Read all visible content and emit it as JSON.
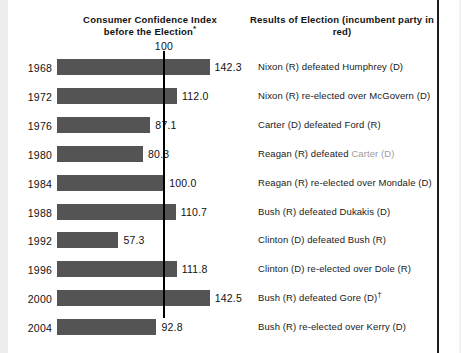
{
  "chart_data": {
    "type": "bar",
    "title": "Consumer Confidence Index before the Election*",
    "right_header": "Results of Election (incumbent party in red)",
    "xlabel": "",
    "ylabel": "",
    "orientation": "horizontal",
    "reference_line": {
      "value": 100,
      "label": "100"
    },
    "xlim": [
      0,
      160
    ],
    "grid": false,
    "legend": null,
    "bar_color": "#545454",
    "incumbent_color": "#9c9c9c",
    "categories": [
      "1968",
      "1972",
      "1976",
      "1980",
      "1984",
      "1988",
      "1992",
      "1996",
      "2000",
      "2004"
    ],
    "values": [
      142.3,
      112.0,
      87.1,
      80.3,
      100.0,
      110.7,
      57.3,
      111.8,
      142.5,
      92.8
    ],
    "value_labels": [
      "142.3",
      "112.0",
      "87.1",
      "80.3",
      "100.0",
      "110.7",
      "57.3",
      "111.8",
      "142.5",
      "92.8"
    ],
    "rows": [
      {
        "year": "1968",
        "value": 142.3,
        "value_label": "142.3",
        "result_pre": "Nixon (R) defeated Humphrey (D)",
        "result_incumbent": "",
        "result_post": "",
        "note": ""
      },
      {
        "year": "1972",
        "value": 112.0,
        "value_label": "112.0",
        "result_pre": "Nixon (R) re-elected over McGovern (D)",
        "result_incumbent": "",
        "result_post": "",
        "note": ""
      },
      {
        "year": "1976",
        "value": 87.1,
        "value_label": "87.1",
        "result_pre": "Carter (D) defeated Ford (R)",
        "result_incumbent": "",
        "result_post": "",
        "note": ""
      },
      {
        "year": "1980",
        "value": 80.3,
        "value_label": "80.3",
        "result_pre": "Reagan (R) defeated ",
        "result_incumbent": "Carter (D)",
        "result_post": "",
        "note": ""
      },
      {
        "year": "1984",
        "value": 100.0,
        "value_label": "100.0",
        "result_pre": "Reagan (R) re-elected over Mondale (D)",
        "result_incumbent": "",
        "result_post": "",
        "note": ""
      },
      {
        "year": "1988",
        "value": 110.7,
        "value_label": "110.7",
        "result_pre": "Bush (R) defeated Dukakis (D)",
        "result_incumbent": "",
        "result_post": "",
        "note": ""
      },
      {
        "year": "1992",
        "value": 57.3,
        "value_label": "57.3",
        "result_pre": "Clinton (D) defeated Bush (R)",
        "result_incumbent": "",
        "result_post": "",
        "note": ""
      },
      {
        "year": "1996",
        "value": 111.8,
        "value_label": "111.8",
        "result_pre": "Clinton (D) re-elected over Dole (R)",
        "result_incumbent": "",
        "result_post": "",
        "note": ""
      },
      {
        "year": "2000",
        "value": 142.5,
        "value_label": "142.5",
        "result_pre": "Bush (R) defeated Gore (D)",
        "result_incumbent": "",
        "result_post": "",
        "note": "†"
      },
      {
        "year": "2004",
        "value": 92.8,
        "value_label": "92.8",
        "result_pre": "Bush (R) re-elected over Kerry (D)",
        "result_incumbent": "",
        "result_post": "",
        "note": ""
      }
    ]
  },
  "header": {
    "left_title_line1": "Consumer Confidence Index",
    "left_title_line2": "before the Election",
    "left_title_marker": "*",
    "right_title": "Results of Election (incumbent party in red)"
  }
}
